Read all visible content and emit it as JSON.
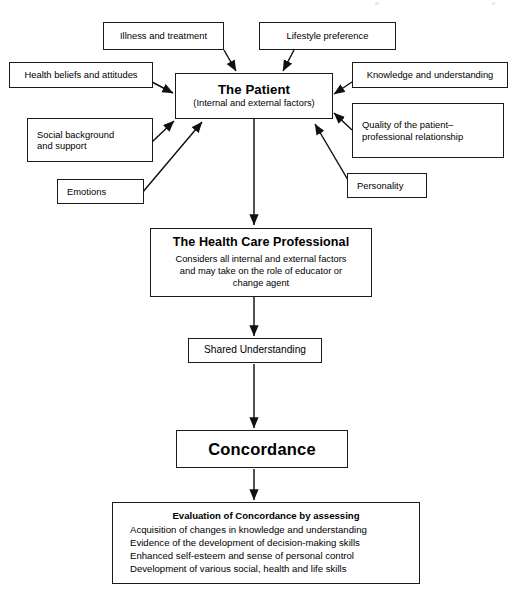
{
  "diagram": {
    "accent_color": "#000000",
    "background_color": "#ffffff"
  },
  "nodes": {
    "illness": {
      "label": "Illness and treatment"
    },
    "lifestyle": {
      "label": "Lifestyle preference"
    },
    "health_beliefs": {
      "label": "Health beliefs and attitudes"
    },
    "knowledge": {
      "label": "Knowledge and understanding"
    },
    "social_background": {
      "line1": "Social background",
      "line2": "and support"
    },
    "quality_relationship": {
      "line1": "Quality of the patient–",
      "line2": "professional relationship"
    },
    "emotions": {
      "label": "Emotions"
    },
    "personality": {
      "label": "Personality"
    },
    "patient": {
      "title": "The Patient",
      "subtitle": "(Internal and external factors)"
    },
    "health_care_professional": {
      "title": "The Health Care Professional",
      "body_line1": "Considers all internal and external factors",
      "body_line2": "and may take on the role of educator or",
      "body_line3": "change agent"
    },
    "shared_understanding": {
      "label": "Shared Understanding"
    },
    "concordance": {
      "label": "Concordance"
    },
    "evaluation": {
      "heading": "Evaluation of Concordance by assessing",
      "items": [
        "Acquisition of changes in knowledge and understanding",
        "Evidence of the development of decision-making skills",
        "Enhanced self-esteem and sense of personal control",
        "Development of various social, health and life skills"
      ]
    }
  }
}
